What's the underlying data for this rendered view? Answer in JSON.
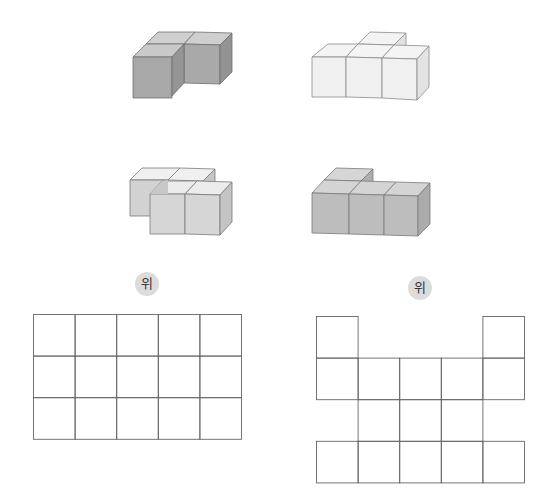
{
  "figures": [
    {
      "id": "shape-a",
      "description": "3 cubes: back row 2, front-left 1 (dark gray)",
      "color": {
        "top": "#c9c9c9",
        "front": "#a8a8a8",
        "side": "#959595"
      }
    },
    {
      "id": "shape-b",
      "description": "4 cubes: front row 3, back-middle 1 (white)",
      "color": {
        "top": "#f2f2f2",
        "front": "#f0f0f0",
        "side": "#e4e4e4"
      }
    },
    {
      "id": "shape-c",
      "description": "4 cubes: back row 2, front row 2 shifted right (light gray)",
      "color": {
        "top": "#ececec",
        "front": "#d6d6d6",
        "side": "#c8c8c8"
      }
    },
    {
      "id": "shape-d",
      "description": "4 cubes: front row 3, back-left 1 (medium gray)",
      "color": {
        "top": "#d4d4d4",
        "front": "#bdbdbd",
        "side": "#adadad"
      }
    }
  ],
  "labels": {
    "left_top": "위",
    "right_top": "위"
  },
  "grids": {
    "left": {
      "rows": 3,
      "cols": 5,
      "cell": 41.6,
      "filled": [
        [
          1,
          1,
          1,
          1,
          1
        ],
        [
          1,
          1,
          1,
          1,
          1
        ],
        [
          1,
          1,
          1,
          1,
          1
        ]
      ]
    },
    "right": {
      "rows": 4,
      "cols": 5,
      "cell": 41.6,
      "filled": [
        [
          1,
          0,
          0,
          0,
          1
        ],
        [
          1,
          1,
          1,
          1,
          1
        ],
        [
          0,
          1,
          1,
          1,
          0
        ],
        [
          1,
          1,
          1,
          1,
          1
        ]
      ]
    }
  },
  "colors": {
    "grid_line": "#666666",
    "cube_edge": "#707070"
  }
}
